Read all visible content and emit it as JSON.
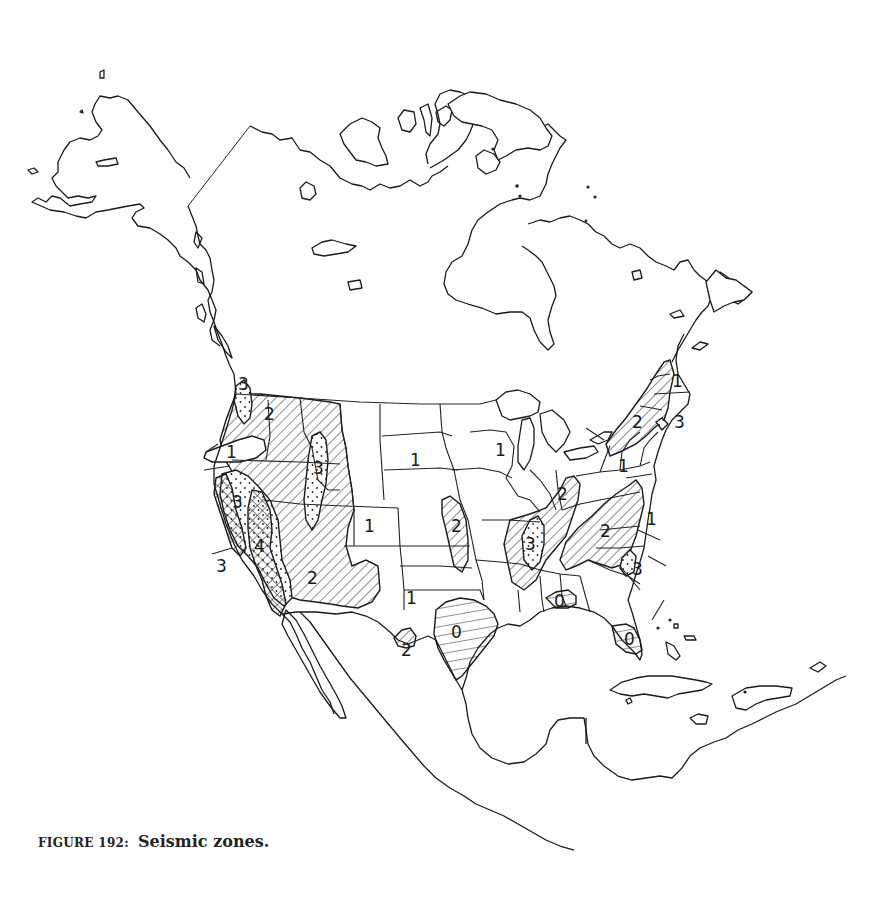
{
  "figure": {
    "number_label": "FIGURE 192:",
    "title": "Seismic zones."
  },
  "map": {
    "subject": "North America",
    "pattern_legend_implied": {
      "0": "horizontal hatching",
      "1": "no fill",
      "2": "diagonal hatching",
      "3": "diagonal hatching with stipple dots",
      "4": "cross-hatching"
    },
    "zone_labels": [
      {
        "id": "pnw-3",
        "text": "3",
        "x": 238,
        "y": 390
      },
      {
        "id": "wa-2",
        "text": "2",
        "x": 268,
        "y": 418
      },
      {
        "id": "or-1",
        "text": "1",
        "x": 230,
        "y": 455
      },
      {
        "id": "id-mt-3",
        "text": "3",
        "x": 318,
        "y": 470
      },
      {
        "id": "ca-north-3",
        "text": "3",
        "x": 236,
        "y": 504
      },
      {
        "id": "ca-4",
        "text": "4",
        "x": 258,
        "y": 548
      },
      {
        "id": "ca-south-3",
        "text": "3",
        "x": 220,
        "y": 568
      },
      {
        "id": "az-2",
        "text": "2",
        "x": 312,
        "y": 580
      },
      {
        "id": "sd-1",
        "text": "1",
        "x": 414,
        "y": 462
      },
      {
        "id": "co-1",
        "text": "1",
        "x": 368,
        "y": 528
      },
      {
        "id": "ks-2",
        "text": "2",
        "x": 455,
        "y": 528
      },
      {
        "id": "wi-1",
        "text": "1",
        "x": 499,
        "y": 452
      },
      {
        "id": "tx-1",
        "text": "1",
        "x": 410,
        "y": 600
      },
      {
        "id": "tx-border-2",
        "text": "2",
        "x": 405,
        "y": 652
      },
      {
        "id": "tx-gulf-0",
        "text": "0",
        "x": 455,
        "y": 634
      },
      {
        "id": "gulf-0",
        "text": "0",
        "x": 558,
        "y": 603
      },
      {
        "id": "fl-0",
        "text": "0",
        "x": 628,
        "y": 641
      },
      {
        "id": "in-2",
        "text": "2",
        "x": 561,
        "y": 496
      },
      {
        "id": "mo-3",
        "text": "3",
        "x": 529,
        "y": 546
      },
      {
        "id": "va-2",
        "text": "2",
        "x": 604,
        "y": 533
      },
      {
        "id": "east-1",
        "text": "1",
        "x": 650,
        "y": 521
      },
      {
        "id": "sc-3",
        "text": "3",
        "x": 636,
        "y": 571
      },
      {
        "id": "ny-1",
        "text": "1",
        "x": 622,
        "y": 468
      },
      {
        "id": "nh-2",
        "text": "2",
        "x": 636,
        "y": 424
      },
      {
        "id": "ne-3",
        "text": "3",
        "x": 678,
        "y": 424
      },
      {
        "id": "me-1",
        "text": "1",
        "x": 676,
        "y": 383
      }
    ]
  }
}
